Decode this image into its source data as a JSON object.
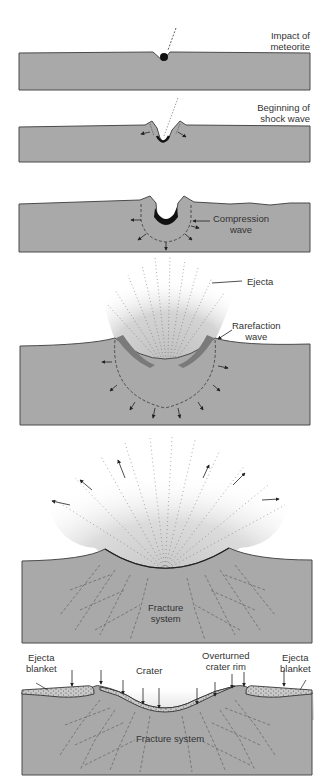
{
  "diagram": {
    "colors": {
      "ground": "#a9a9a9",
      "ground_edge": "#4a4a4a",
      "meteorite": "#111111",
      "ejecta_haze": "#c8c8c8",
      "background": "#ffffff"
    },
    "stages": [
      {
        "id": 1,
        "label_lines": [
          "Impact of",
          "meteorite"
        ]
      },
      {
        "id": 2,
        "label_lines": [
          "Beginning of",
          "shock wave"
        ]
      },
      {
        "id": 3,
        "label_lines": [
          "Compression",
          "wave"
        ]
      },
      {
        "id": 4,
        "labels": {
          "ejecta": "Ejecta",
          "rarefaction": [
            "Rarefaction",
            "wave"
          ]
        }
      },
      {
        "id": 5,
        "label_lines": [
          "Fracture",
          "system"
        ]
      },
      {
        "id": 6,
        "labels": {
          "ejecta_blanket_left": [
            "Ejecta",
            "blanket"
          ],
          "crater": "Crater",
          "overturned_rim": [
            "Overturned",
            "crater rim"
          ],
          "ejecta_blanket_right": [
            "Ejecta",
            "blanket"
          ],
          "fracture_system": "Fracture system"
        }
      }
    ]
  }
}
